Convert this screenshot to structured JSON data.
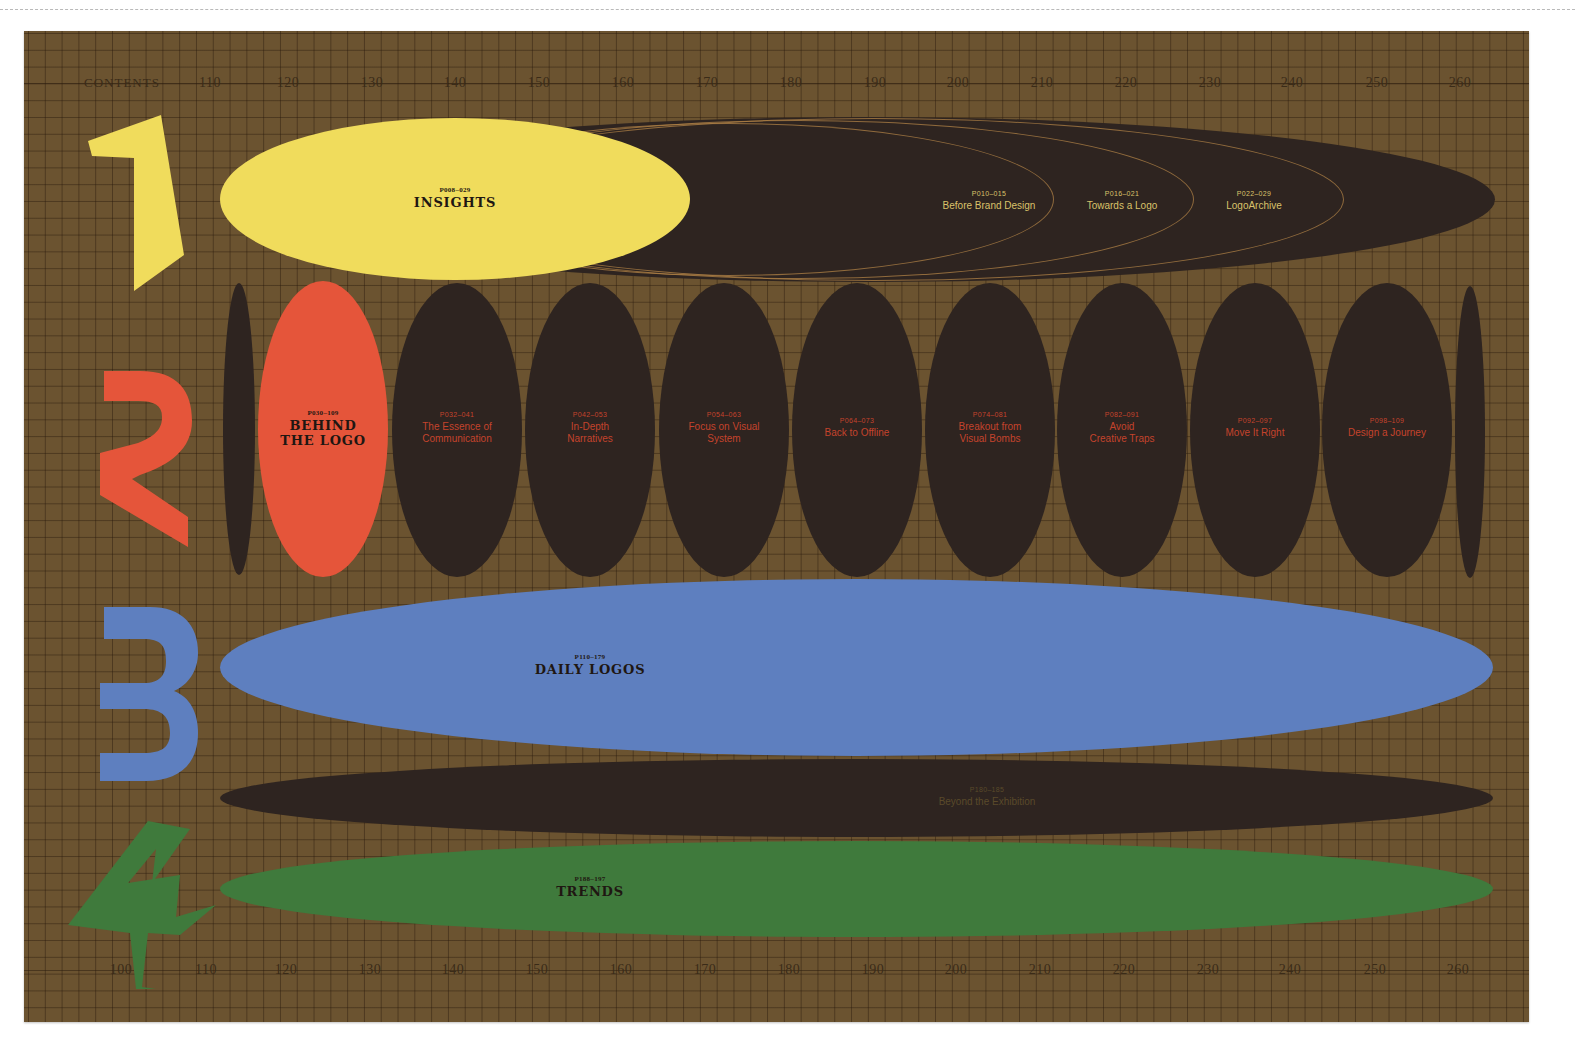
{
  "title": "CONTENTS",
  "ruler_top": {
    "label": "CONTENTS",
    "ticks": [
      "110",
      "120",
      "130",
      "140",
      "150",
      "160",
      "170",
      "180",
      "190",
      "200",
      "210",
      "220",
      "230",
      "240",
      "250",
      "260"
    ]
  },
  "ruler_bottom": {
    "ticks": [
      "100",
      "110",
      "120",
      "130",
      "140",
      "150",
      "160",
      "170",
      "180",
      "190",
      "200",
      "210",
      "220",
      "230",
      "240",
      "250",
      "260"
    ]
  },
  "colors": {
    "background": "#6b5330",
    "dark_ellipse": "#2e2420",
    "section_1": "#f0dc5c",
    "section_2": "#e5553a",
    "section_3": "#5e7fbf",
    "section_4": "#3f7a3c",
    "gold_text": "#d9c26a",
    "red_text": "#c4432c"
  },
  "sections": [
    {
      "number": "1",
      "pages": "P008–029",
      "title": "INSIGHTS",
      "chapters": [
        {
          "pages": "P010–015",
          "title": "Before Brand Design"
        },
        {
          "pages": "P016–021",
          "title": "Towards a Logo"
        },
        {
          "pages": "P022–029",
          "title": "LogoArchive"
        }
      ]
    },
    {
      "number": "2",
      "pages": "P030–109",
      "title_line1": "BEHIND",
      "title_line2": "THE LOGO",
      "chapters": [
        {
          "pages": "P032–041",
          "line1": "The Essence of",
          "line2": "Communication"
        },
        {
          "pages": "P042–053",
          "line1": "In-Depth",
          "line2": "Narratives"
        },
        {
          "pages": "P054–063",
          "line1": "Focus on Visual",
          "line2": "System"
        },
        {
          "pages": "P064–073",
          "line1": "Back to Offline",
          "line2": ""
        },
        {
          "pages": "P074–081",
          "line1": "Breakout from",
          "line2": "Visual Bombs"
        },
        {
          "pages": "P082–091",
          "line1": "Avoid",
          "line2": "Creative Traps"
        },
        {
          "pages": "P092–097",
          "line1": "Move It Right",
          "line2": ""
        },
        {
          "pages": "P098–109",
          "line1": "Design a Journey",
          "line2": ""
        }
      ]
    },
    {
      "number": "3",
      "pages": "P110–179",
      "title": "DAILY LOGOS"
    },
    {
      "number": "4",
      "extra": {
        "pages": "P180–185",
        "title": "Beyond the Exhibition"
      },
      "pages": "P188–197",
      "title": "TRENDS"
    }
  ]
}
